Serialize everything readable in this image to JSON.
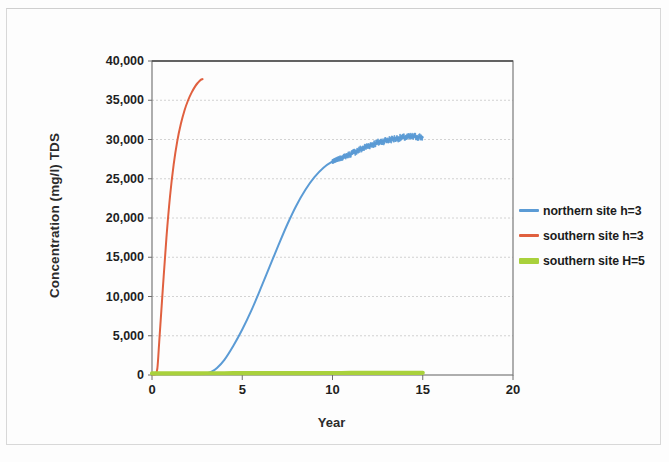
{
  "chart_data": {
    "type": "line",
    "title": "",
    "xlabel": "Year",
    "ylabel": "Concentration (mg/l) TDS",
    "xlim": [
      0,
      20
    ],
    "ylim": [
      0,
      40000
    ],
    "xticks": [
      "0",
      "5",
      "10",
      "15",
      "20"
    ],
    "yticks": [
      "0",
      "5,000",
      "10,000",
      "15,000",
      "20,000",
      "25,000",
      "30,000",
      "35,000",
      "40,000"
    ],
    "grid": "horizontal-only",
    "legend_position": "right",
    "series": [
      {
        "name": "northern site h=3",
        "color": "#5b9bd5",
        "x": [
          0,
          0.5,
          1,
          1.5,
          2,
          2.5,
          3,
          3.3,
          3.6,
          4,
          4.5,
          5,
          5.5,
          6,
          6.5,
          7,
          7.5,
          8,
          8.5,
          9,
          9.5,
          10,
          10.3,
          10.6,
          11,
          11.5,
          12,
          12.5,
          13,
          13.5,
          14,
          14.5,
          15
        ],
        "y": [
          120,
          120,
          125,
          130,
          135,
          150,
          200,
          420,
          900,
          1900,
          3700,
          5800,
          8200,
          10900,
          13700,
          16500,
          19200,
          21600,
          23600,
          25200,
          26400,
          27200,
          27500,
          27750,
          28150,
          28700,
          29200,
          29600,
          29900,
          30120,
          30280,
          30380,
          30300
        ]
      },
      {
        "name": "southern site h=3",
        "color": "#e0603f",
        "x": [
          0,
          0.2,
          0.3,
          0.4,
          0.6,
          0.8,
          1.0,
          1.2,
          1.4,
          1.6,
          1.8,
          2.0,
          2.2,
          2.4,
          2.55,
          2.7,
          2.8
        ],
        "y": [
          120,
          130,
          900,
          4200,
          11000,
          17500,
          22800,
          26800,
          29800,
          32000,
          33700,
          35000,
          36000,
          36800,
          37250,
          37600,
          37700
        ]
      },
      {
        "name": "southern site H=5",
        "color": "#a9d13c",
        "x": [
          0,
          1,
          2,
          3,
          4,
          5,
          6,
          7,
          8,
          9,
          10,
          11,
          12,
          13,
          14,
          15
        ],
        "y": [
          200,
          210,
          215,
          220,
          225,
          230,
          235,
          240,
          245,
          250,
          255,
          260,
          265,
          270,
          275,
          280
        ]
      }
    ]
  },
  "axes": {
    "y_title": "Concentration (mg/l) TDS",
    "x_title": "Year"
  },
  "legend": {
    "items": [
      {
        "label": "northern site h=3",
        "color": "#5b9bd5",
        "thick": false
      },
      {
        "label": "southern site h=3",
        "color": "#e0603f",
        "thick": false
      },
      {
        "label": "southern site H=5",
        "color": "#a9d13c",
        "thick": true
      }
    ]
  }
}
